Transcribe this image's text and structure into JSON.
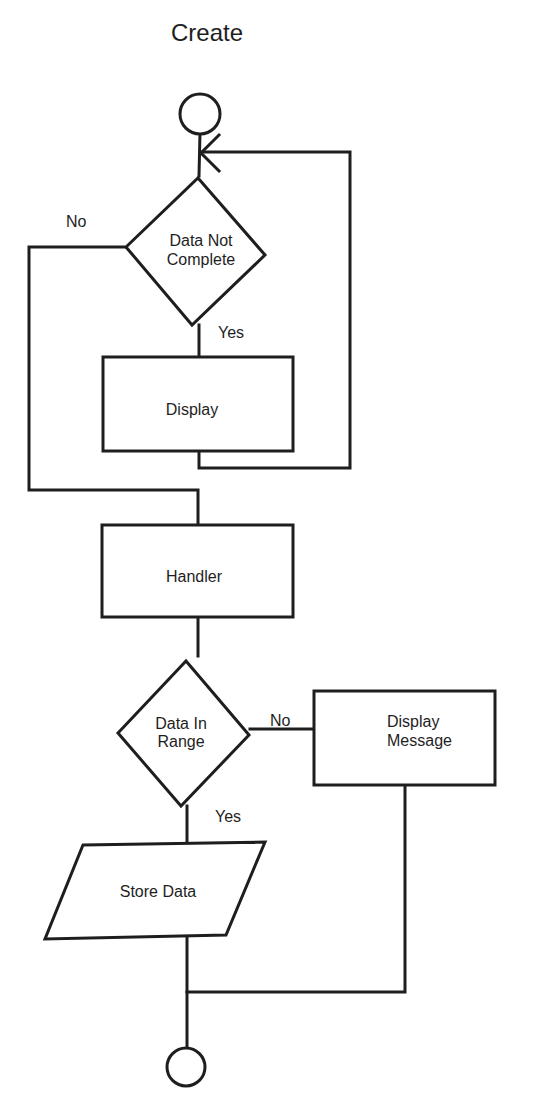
{
  "title": "Create",
  "colors": {
    "line": "#1e1e1e",
    "background": "#ffffff"
  },
  "nodes": {
    "start": {
      "type": "terminal-circle"
    },
    "decision_complete": {
      "type": "decision",
      "lines": [
        "Data Not",
        "Complete"
      ]
    },
    "display": {
      "type": "process",
      "label": "Display"
    },
    "handler": {
      "type": "process",
      "label": "Handler"
    },
    "decision_range": {
      "type": "decision",
      "lines": [
        "Data In",
        "Range"
      ]
    },
    "display_message": {
      "type": "process",
      "lines": [
        "Display",
        "Message"
      ]
    },
    "store_data": {
      "type": "input-output",
      "label": "Store Data"
    },
    "end": {
      "type": "terminal-circle"
    }
  },
  "edges": {
    "complete_no": {
      "from": "decision_complete",
      "to": "handler",
      "label": "No"
    },
    "complete_yes": {
      "from": "decision_complete",
      "to": "display",
      "label": "Yes"
    },
    "display_loop": {
      "from": "display",
      "to": "start"
    },
    "handler_to_range": {
      "from": "handler",
      "to": "decision_range"
    },
    "range_no": {
      "from": "decision_range",
      "to": "display_message",
      "label": "No"
    },
    "range_yes": {
      "from": "decision_range",
      "to": "store_data",
      "label": "Yes"
    },
    "store_to_end": {
      "from": "store_data",
      "to": "end"
    },
    "message_to_end": {
      "from": "display_message",
      "to": "end"
    }
  }
}
